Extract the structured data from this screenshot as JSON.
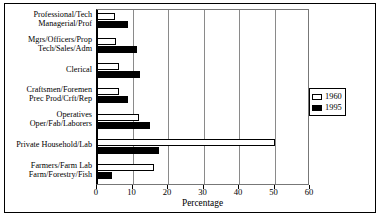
{
  "chart_data": {
    "type": "bar",
    "orientation": "horizontal",
    "title": "",
    "xlabel": "Percentage",
    "ylabel": "",
    "xlim": [
      0,
      60
    ],
    "xticks": [
      0,
      10,
      20,
      30,
      40,
      50,
      60
    ],
    "grid": true,
    "legend_position": "right",
    "categories": [
      "Professional/Tech\nManagerial/Prof",
      "Mgrs/Officers/Prop\nTech/Sales/Adm",
      "Clerical",
      "Craftsmen/Foremen\nPrec Prod/Crft/Rep",
      "Operatives\nOper/Fab/Laborers",
      "Private Household/Lab",
      "Farmers/Farm Lab\nFarm/Forestry/Fish"
    ],
    "category_lines": [
      [
        "Professional/Tech",
        "Managerial/Prof"
      ],
      [
        "Mgrs/Officers/Prop",
        "Tech/Sales/Adm"
      ],
      [
        "Clerical"
      ],
      [
        "Craftsmen/Foremen",
        "Prec Prod/Crft/Rep"
      ],
      [
        "Operatives",
        "Oper/Fab/Laborers"
      ],
      [
        "Private Household/Lab"
      ],
      [
        "Farmers/Farm Lab",
        "Farm/Forestry/Fish"
      ]
    ],
    "series": [
      {
        "name": "1960",
        "color": "#ffffff",
        "values": [
          5.0,
          5.3,
          6.2,
          6.2,
          11.8,
          50.0,
          16.0
        ]
      },
      {
        "name": "1995",
        "color": "#000000",
        "values": [
          8.7,
          11.3,
          12.0,
          8.7,
          15.0,
          17.5,
          4.2
        ]
      }
    ]
  },
  "legend": {
    "items": [
      {
        "label": "1960",
        "swatch": "hollow-square-swatch"
      },
      {
        "label": "1995",
        "swatch": "filled-square-swatch"
      }
    ]
  },
  "axis": {
    "x_title": "Percentage",
    "tick_labels": [
      "0",
      "10",
      "20",
      "30",
      "40",
      "50",
      "60"
    ]
  }
}
